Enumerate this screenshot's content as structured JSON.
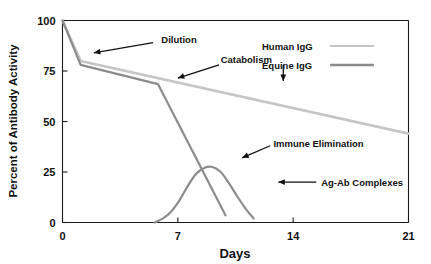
{
  "chart_data": {
    "type": "line",
    "title": "",
    "xlabel": "Days",
    "ylabel": "Percent of Antibody Activity",
    "xlim": [
      0,
      21
    ],
    "ylim": [
      0,
      100
    ],
    "xticks": [
      0,
      7,
      14,
      21
    ],
    "yticks": [
      0,
      25,
      50,
      75,
      100
    ],
    "xtick_labels": [
      "0",
      "7",
      "14",
      "21"
    ],
    "ytick_labels": [
      "0",
      "25",
      "50",
      "75",
      "100"
    ],
    "grid": false,
    "legend_position": "top-right",
    "series": [
      {
        "name": "Human IgG",
        "color": "#c6c6c6",
        "width": 2.6,
        "x": [
          0.0,
          1.1,
          21.0
        ],
        "y": [
          100.0,
          80.0,
          44.0
        ]
      },
      {
        "name": "Equine IgG",
        "color": "#8c8c8c",
        "width": 2.2,
        "x": [
          0.0,
          1.1,
          5.8,
          9.9
        ],
        "y": [
          100.0,
          78.0,
          68.5,
          3.5
        ]
      },
      {
        "name": "Ag-Ab Complexes",
        "color": "#8c8c8c",
        "width": 2.2,
        "x": [
          5.6,
          6.1,
          6.6,
          7.1,
          7.6,
          8.1,
          8.6,
          9.1,
          9.6,
          10.1,
          10.6,
          11.1,
          11.6
        ],
        "y": [
          0.0,
          2.0,
          5.5,
          11.0,
          18.0,
          24.0,
          27.0,
          27.5,
          25.0,
          19.5,
          13.0,
          7.0,
          2.0
        ]
      }
    ],
    "annotations": [
      {
        "label": "Dilution",
        "text_x": 6.0,
        "text_y": 90.5,
        "arrows": [
          {
            "tail_x": 5.5,
            "tail_y": 89.0,
            "head_x": 1.9,
            "head_y": 84.0
          }
        ]
      },
      {
        "label": "Catabolism",
        "text_x": 9.6,
        "text_y": 80.5,
        "arrows": [
          {
            "tail_x": 9.5,
            "tail_y": 78.0,
            "head_x": 7.0,
            "head_y": 71.5
          },
          {
            "tail_x": 13.4,
            "tail_y": 78.0,
            "head_x": 13.4,
            "head_y": 70.0
          }
        ]
      },
      {
        "label": "Immune Elimination",
        "text_x": 12.8,
        "text_y": 39.0,
        "arrows": [
          {
            "tail_x": 12.6,
            "tail_y": 38.0,
            "head_x": 10.9,
            "head_y": 32.0
          }
        ]
      },
      {
        "label": "Ag-Ab Complexes",
        "text_x": 15.7,
        "text_y": 20.0,
        "arrows": [
          {
            "tail_x": 15.4,
            "tail_y": 20.0,
            "head_x": 13.1,
            "head_y": 20.0
          }
        ]
      }
    ],
    "legend_entries": [
      {
        "name": "Human IgG",
        "color": "#c6c6c6",
        "width": 2.2
      },
      {
        "name": "Equine IgG",
        "color": "#8c8c8c",
        "width": 2.4
      }
    ]
  },
  "colors": {
    "axis": "#1a1a1a",
    "text": "#111111",
    "background": "#ffffff",
    "human_igg": "#c6c6c6",
    "equine_igg": "#8c8c8c"
  }
}
